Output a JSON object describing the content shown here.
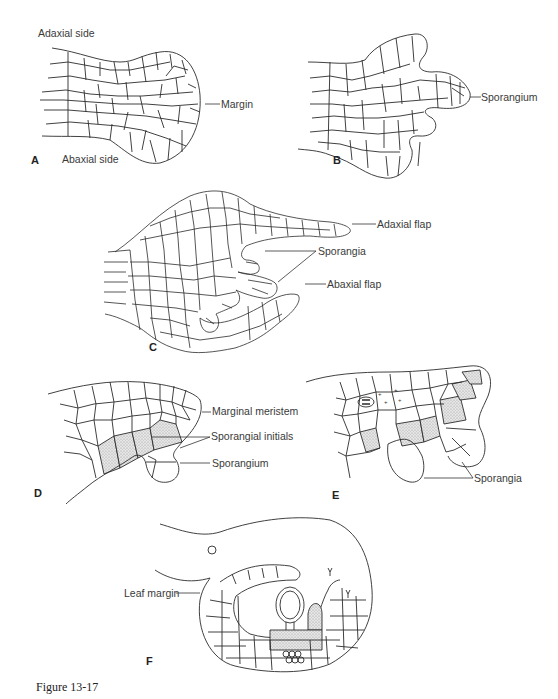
{
  "figure": {
    "caption": "Figure 13-17",
    "panels": {
      "A": {
        "letter": "A",
        "labels": {
          "adaxial": "Adaxial side",
          "abaxial": "Abaxial side",
          "margin": "Margin"
        }
      },
      "B": {
        "letter": "B",
        "labels": {
          "sporangium": "Sporangium"
        }
      },
      "C": {
        "letter": "C",
        "labels": {
          "adaxial_flap": "Adaxial flap",
          "sporangia": "Sporangia",
          "abaxial_flap": "Abaxial flap"
        }
      },
      "D": {
        "letter": "D",
        "labels": {
          "marginal_meristem": "Marginal meristem",
          "sporangial_initials": "Sporangial initials",
          "sporangium": "Sporangium"
        }
      },
      "E": {
        "letter": "E",
        "labels": {
          "sporangia": "Sporangia"
        }
      },
      "F": {
        "letter": "F",
        "labels": {
          "leaf_margin": "Leaf margin"
        }
      }
    },
    "colors": {
      "line": "#2b2b2b",
      "stipple": "#d4d4d4",
      "background": "#ffffff"
    }
  }
}
